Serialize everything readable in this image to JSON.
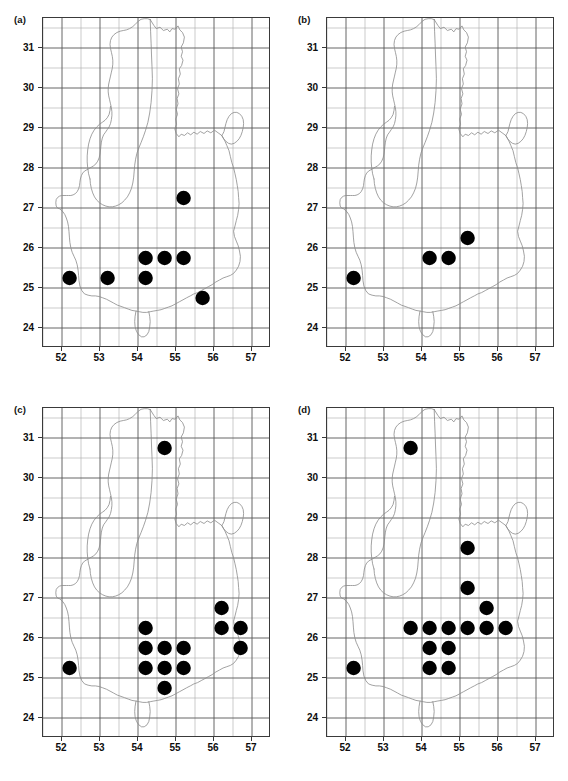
{
  "figure": {
    "panel_count": 4,
    "background": "#ffffff",
    "point_color": "#000000",
    "grid_major_color": "#555555",
    "grid_minor_color": "#aaaaaa",
    "outline_color": "#8a8a8a",
    "frame_color": "#3a3a3a"
  },
  "axes": {
    "xlabels": [
      "52",
      "53",
      "54",
      "55",
      "56",
      "57"
    ],
    "ylabels": [
      "24",
      "25",
      "26",
      "27",
      "28",
      "29",
      "30",
      "31"
    ],
    "xlim": [
      51.5,
      57.5
    ],
    "ylim": [
      23.5,
      31.75
    ],
    "xmajor_step": 1,
    "xminor_step": 0.5,
    "ymajor_step": 1,
    "yminor_step": 0.5,
    "grid": true
  },
  "chart_data": [
    {
      "type": "scatter",
      "title": "(a)",
      "xlabel": "",
      "ylabel": "",
      "xlim": [
        51.5,
        57.5
      ],
      "ylim": [
        23.5,
        31.75
      ],
      "grid": true,
      "marker": "filled-circle",
      "marker_color": "#000000",
      "points": [
        {
          "x": 52.2,
          "y": 25.25
        },
        {
          "x": 53.2,
          "y": 25.25
        },
        {
          "x": 54.2,
          "y": 25.25
        },
        {
          "x": 54.2,
          "y": 25.75
        },
        {
          "x": 54.7,
          "y": 25.75
        },
        {
          "x": 55.2,
          "y": 25.75
        },
        {
          "x": 55.2,
          "y": 27.25
        },
        {
          "x": 55.7,
          "y": 24.75
        }
      ]
    },
    {
      "type": "scatter",
      "title": "(b)",
      "xlabel": "",
      "ylabel": "",
      "xlim": [
        51.5,
        57.5
      ],
      "ylim": [
        23.5,
        31.75
      ],
      "grid": true,
      "marker": "filled-circle",
      "marker_color": "#000000",
      "points": [
        {
          "x": 52.2,
          "y": 25.25
        },
        {
          "x": 54.2,
          "y": 25.75
        },
        {
          "x": 54.7,
          "y": 25.75
        },
        {
          "x": 55.2,
          "y": 26.25
        }
      ]
    },
    {
      "type": "scatter",
      "title": "(c)",
      "xlabel": "",
      "ylabel": "",
      "xlim": [
        51.5,
        57.5
      ],
      "ylim": [
        23.5,
        31.75
      ],
      "grid": true,
      "marker": "filled-circle",
      "marker_color": "#000000",
      "points": [
        {
          "x": 54.7,
          "y": 30.75
        },
        {
          "x": 52.2,
          "y": 25.25
        },
        {
          "x": 54.2,
          "y": 26.25
        },
        {
          "x": 54.2,
          "y": 25.75
        },
        {
          "x": 54.7,
          "y": 25.75
        },
        {
          "x": 55.2,
          "y": 25.75
        },
        {
          "x": 54.2,
          "y": 25.25
        },
        {
          "x": 54.7,
          "y": 25.25
        },
        {
          "x": 55.2,
          "y": 25.25
        },
        {
          "x": 54.7,
          "y": 24.75
        },
        {
          "x": 56.2,
          "y": 26.75
        },
        {
          "x": 56.2,
          "y": 26.25
        },
        {
          "x": 56.7,
          "y": 26.25
        },
        {
          "x": 56.7,
          "y": 25.75
        }
      ]
    },
    {
      "type": "scatter",
      "title": "(d)",
      "xlabel": "",
      "ylabel": "",
      "xlim": [
        51.5,
        57.5
      ],
      "ylim": [
        23.5,
        31.75
      ],
      "grid": true,
      "marker": "filled-circle",
      "marker_color": "#000000",
      "points": [
        {
          "x": 53.7,
          "y": 30.75
        },
        {
          "x": 55.2,
          "y": 28.25
        },
        {
          "x": 55.2,
          "y": 27.25
        },
        {
          "x": 55.7,
          "y": 26.75
        },
        {
          "x": 52.2,
          "y": 25.25
        },
        {
          "x": 53.7,
          "y": 26.25
        },
        {
          "x": 54.2,
          "y": 26.25
        },
        {
          "x": 54.7,
          "y": 26.25
        },
        {
          "x": 55.2,
          "y": 26.25
        },
        {
          "x": 55.7,
          "y": 26.25
        },
        {
          "x": 56.2,
          "y": 26.25
        },
        {
          "x": 54.2,
          "y": 25.75
        },
        {
          "x": 54.7,
          "y": 25.75
        },
        {
          "x": 54.2,
          "y": 25.25
        },
        {
          "x": 54.7,
          "y": 25.25
        }
      ]
    }
  ],
  "map_outline": {
    "description": "regional administrative boundary polyline",
    "stroke": "#8a8a8a"
  }
}
